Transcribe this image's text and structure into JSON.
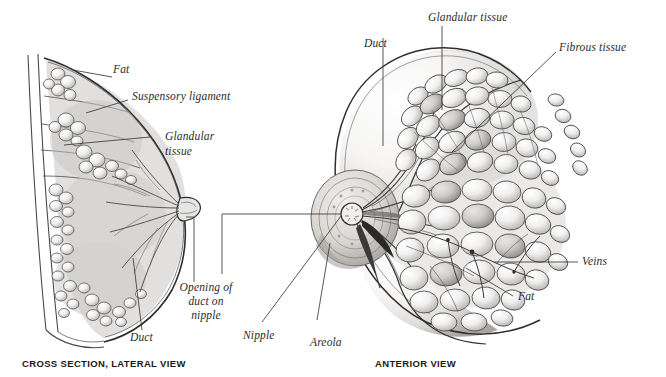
{
  "figure": {
    "background_color": "#ffffff",
    "ink_color": "#2b2b2b",
    "line_color": "#4a4a4a"
  },
  "captions": [
    {
      "id": "lateral",
      "text": "CROSS SECTION, LATERAL VIEW"
    },
    {
      "id": "anterior",
      "text": "ANTERIOR VIEW"
    }
  ],
  "labels": {
    "fat_left": "Fat",
    "suspensory_ligament": "Suspensory ligament",
    "glandular_tissue_left_line1": "Glandular",
    "glandular_tissue_left_line2": "tissue",
    "duct_left": "Duct",
    "opening_line1": "Opening of",
    "opening_line2": "duct on",
    "opening_line3": "nipple",
    "nipple": "Nipple",
    "areola": "Areola",
    "duct_right": "Duct",
    "glandular_tissue_right": "Glandular tissue",
    "fibrous_tissue": "Fibrous tissue",
    "veins": "Veins",
    "fat_right": "Fat"
  },
  "diagram_parts": {
    "lateral_view": [
      "chest wall",
      "fat",
      "suspensory ligament",
      "glandular tissue",
      "duct",
      "nipple",
      "opening of duct on nipple"
    ],
    "anterior_view": [
      "breast contour",
      "areola",
      "nipple",
      "duct",
      "glandular tissue",
      "fibrous tissue",
      "veins",
      "fat"
    ]
  }
}
